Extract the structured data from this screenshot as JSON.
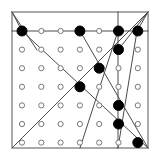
{
  "figure": {
    "type": "geometric-diagram",
    "width": 160,
    "height": 167,
    "background_color": "#ffffff"
  },
  "frame": {
    "name": "outer-square-border",
    "x": 12,
    "y": 12,
    "width": 136,
    "height": 136,
    "stroke_color": "#555555",
    "stroke_width": 1,
    "fill": "none"
  },
  "grid": {
    "columns": 7,
    "rows": 7,
    "origin_x": 22,
    "origin_y": 31,
    "spacing_x": 19.3,
    "spacing_y": 18.6,
    "open_dot": {
      "radius": 2.6,
      "fill_color": "#ffffff",
      "stroke_color": "#777777",
      "stroke_width": 1
    },
    "filled_dot": {
      "radius": 5.0,
      "fill_color": "#000000",
      "stroke_color": "#000000",
      "stroke_width": 1
    },
    "filled_nodes": [
      {
        "col": 0,
        "row": 0
      },
      {
        "col": 3,
        "row": 0
      },
      {
        "col": 5,
        "row": 0
      },
      {
        "col": 6,
        "row": 0
      },
      {
        "col": 5,
        "row": 1
      },
      {
        "col": 4,
        "row": 2
      },
      {
        "col": 3,
        "row": 3
      },
      {
        "col": 5,
        "row": 4
      },
      {
        "col": 5,
        "row": 5
      },
      {
        "col": 6,
        "row": 6
      }
    ],
    "dot_states": [
      [
        "filled",
        "open",
        "open",
        "filled",
        "open",
        "filled",
        "filled"
      ],
      [
        "open",
        "open",
        "open",
        "open",
        "open",
        "filled",
        "open"
      ],
      [
        "open",
        "open",
        "open",
        "open",
        "filled",
        "open",
        "open"
      ],
      [
        "open",
        "open",
        "open",
        "filled",
        "open",
        "open",
        "open"
      ],
      [
        "open",
        "open",
        "open",
        "open",
        "open",
        "filled",
        "open"
      ],
      [
        "open",
        "open",
        "open",
        "open",
        "open",
        "filled",
        "open"
      ],
      [
        "open",
        "open",
        "open",
        "open",
        "open",
        "open",
        "filled"
      ]
    ]
  },
  "lines": {
    "stroke_color": "#4a4a4a",
    "stroke_width": 1,
    "segments": [
      {
        "name": "top-horizontal-row-line",
        "x1": 12,
        "y1": 31,
        "x2": 148,
        "y2": 31
      },
      {
        "name": "vertical-line-column-5",
        "x1": 118,
        "y1": 12,
        "x2": 118,
        "y2": 148
      },
      {
        "name": "main-diagonal-topleft-to-bottomright",
        "x1": 22,
        "y1": 31,
        "x2": 148,
        "y2": 148
      },
      {
        "name": "anti-diagonal-bottomleft-to-topright",
        "x1": 12,
        "y1": 148,
        "x2": 148,
        "y2": 12
      },
      {
        "name": "diagonal-node-c3r0-to-bottomright",
        "x1": 80,
        "y1": 31,
        "x2": 148,
        "y2": 148
      },
      {
        "name": "diagonal-node-c5r0-down-left",
        "x1": 118,
        "y1": 31,
        "x2": 80,
        "y2": 148
      },
      {
        "name": "diagonal-node-c6r0-to-bottomleft",
        "x1": 137,
        "y1": 31,
        "x2": 118,
        "y2": 148
      },
      {
        "name": "diagonal-corner-topleft-short",
        "x1": 12,
        "y1": 12,
        "x2": 37,
        "y2": 50
      },
      {
        "name": "diagonal-corner-topright-short",
        "x1": 148,
        "y1": 12,
        "x2": 118,
        "y2": 50
      },
      {
        "name": "edge-left-upper-bevel",
        "x1": 12,
        "y1": 12,
        "x2": 22,
        "y2": 31
      },
      {
        "name": "edge-right-upper-bevel",
        "x1": 148,
        "y1": 12,
        "x2": 137,
        "y2": 31
      }
    ]
  }
}
